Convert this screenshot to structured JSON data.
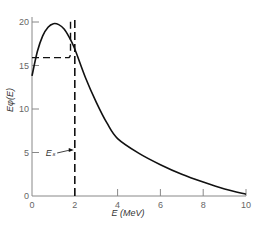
{
  "chart_data": {
    "type": "line",
    "title": "",
    "xlabel": "E (MeV)",
    "ylabel": "Eφ(E)",
    "xlim": [
      0,
      10
    ],
    "ylim": [
      0,
      21
    ],
    "xticks": [
      "0",
      "2",
      "4",
      "6",
      "8",
      "10"
    ],
    "yticks": [
      "0",
      "5",
      "10",
      "15",
      "20"
    ],
    "grid": false,
    "series": [
      {
        "name": "Eφ(E)",
        "style": "solid",
        "x": [
          0,
          0.25,
          0.5,
          0.75,
          1.0,
          1.25,
          1.5,
          1.75,
          2.0,
          2.5,
          3.0,
          3.5,
          4.0,
          5.0,
          6.0,
          7.0,
          8.0,
          9.0,
          10.0
        ],
        "y": [
          13.8,
          16.6,
          18.4,
          19.4,
          19.8,
          19.7,
          19.2,
          18.2,
          16.9,
          13.6,
          10.8,
          8.4,
          6.6,
          4.9,
          3.6,
          2.5,
          1.6,
          0.8,
          0.2
        ]
      },
      {
        "name": "approximation (dashed)",
        "style": "dashed",
        "x": [
          0,
          1.7,
          1.8,
          1.8
        ],
        "y": [
          15.9,
          15.9,
          16.5,
          20.5
        ]
      }
    ],
    "annotations": [
      {
        "text": "Eₛ",
        "x": 0.85,
        "y": 4.6,
        "arrow_to": [
          1.95,
          5.3
        ]
      },
      {
        "type": "vline",
        "x": 2.0,
        "style": "dashed",
        "y_range": [
          0,
          20.5
        ]
      }
    ]
  }
}
